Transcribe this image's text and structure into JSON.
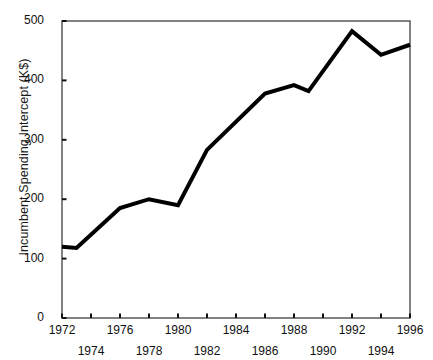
{
  "chart_data": {
    "type": "line",
    "title": "",
    "subtitle": "",
    "xlabel": "",
    "ylabel": "Incumbent Spending Intercept (K$)",
    "xlim": [
      1972,
      1996
    ],
    "ylim": [
      0,
      500
    ],
    "grid": false,
    "legend": null,
    "xticks": [
      1972,
      1974,
      1976,
      1978,
      1980,
      1982,
      1984,
      1986,
      1988,
      1990,
      1992,
      1994,
      1996
    ],
    "xtick_labels": [
      "1972",
      "1974",
      "1976",
      "1978",
      "1980",
      "1982",
      "1984",
      "1986",
      "1988",
      "1990",
      "1992",
      "1994",
      "1996"
    ],
    "xtick_rows": [
      0,
      1,
      0,
      1,
      0,
      1,
      0,
      1,
      0,
      1,
      0,
      1,
      0
    ],
    "yticks": [
      0,
      100,
      200,
      300,
      400,
      500
    ],
    "ytick_labels": [
      "0",
      "100",
      "200",
      "300",
      "400",
      "500"
    ],
    "line_color": "#000000",
    "line_width": 4,
    "frame": true,
    "x": [
      1972,
      1973,
      1976,
      1978,
      1980,
      1982,
      1986,
      1988,
      1989,
      1992,
      1994,
      1996
    ],
    "values": [
      120,
      118,
      185,
      200,
      190,
      283,
      378,
      392,
      382,
      483,
      443,
      460
    ],
    "series": [
      {
        "name": "Incumbent Spending Intercept",
        "x": [
          1972,
          1973,
          1976,
          1978,
          1980,
          1982,
          1986,
          1988,
          1989,
          1992,
          1994,
          1996
        ],
        "values": [
          120,
          118,
          185,
          200,
          190,
          283,
          378,
          392,
          382,
          483,
          443,
          460
        ]
      }
    ]
  }
}
